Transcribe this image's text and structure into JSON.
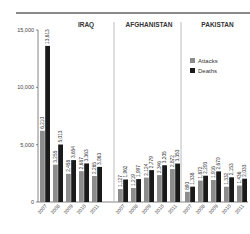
{
  "chart_data": {
    "type": "bar",
    "title": "",
    "xlabel": "",
    "ylabel": "",
    "ylim": [
      0,
      15000
    ],
    "yticks": [
      0,
      5000,
      10000,
      15000
    ],
    "ytick_labels": [
      "0",
      "5,000",
      "10,000",
      "15,000"
    ],
    "legend": {
      "position": "top-right",
      "entries": [
        "Attacks",
        "Deaths"
      ]
    },
    "colors": {
      "Attacks": "#8c8c8c",
      "Deaths": "#1a1a1a"
    },
    "panels": [
      {
        "title": "IRAQ",
        "categories": [
          "2007",
          "2008",
          "2009",
          "2010",
          "2011"
        ],
        "series": [
          {
            "name": "Attacks",
            "values": [
              6210,
              3255,
              2458,
              2687,
              2265
            ],
            "labels": [
              "6,210",
              "3,255",
              "2,458",
              "2,687",
              "2,265"
            ]
          },
          {
            "name": "Deaths",
            "values": [
              13613,
              5013,
              3654,
              3363,
              3063
            ],
            "labels": [
              "13,613",
              "5,013",
              "3,654",
              "3,363",
              "3,063"
            ]
          }
        ]
      },
      {
        "title": "AFGHANISTAN",
        "categories": [
          "2007",
          "2008",
          "2009",
          "2010",
          "2011"
        ],
        "series": [
          {
            "name": "Attacks",
            "values": [
              1127,
              1219,
              2124,
              2346,
              2872
            ],
            "labels": [
              "1,127",
              "1,219",
              "2,124",
              "2,346",
              "2,872"
            ]
          },
          {
            "name": "Deaths",
            "values": [
              1962,
              1997,
              2779,
              3205,
              3353
            ],
            "labels": [
              "1,962",
              "1,997",
              "2,779",
              "3,205",
              "3,353"
            ]
          }
        ]
      },
      {
        "title": "PAKISTAN",
        "categories": [
          "2007",
          "2008",
          "2009",
          "2010",
          "2011"
        ],
        "series": [
          {
            "name": "Attacks",
            "values": [
              890,
              1872,
              1916,
              1332,
              1436
            ],
            "labels": [
              "890",
              "1,872",
              "1,916",
              "1,332",
              "1,436"
            ]
          },
          {
            "name": "Deaths",
            "values": [
              1338,
              2293,
              2670,
              2153,
              2033
            ],
            "labels": [
              "1,338",
              "2,293",
              "2,670",
              "2,153",
              "2,033"
            ]
          }
        ]
      }
    ]
  }
}
